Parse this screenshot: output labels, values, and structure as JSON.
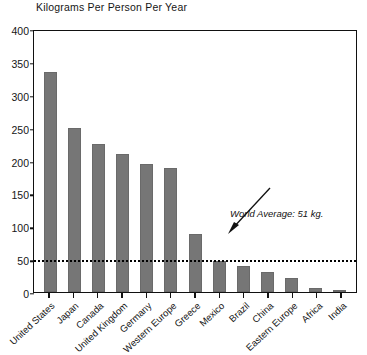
{
  "chart_data": {
    "type": "bar",
    "title": "Kilograms Per Person Per Year",
    "xlabel": "",
    "ylabel": "Kilograms Per Person Per Year",
    "ylim": [
      0,
      400
    ],
    "yticks": [
      400,
      350,
      300,
      250,
      200,
      150,
      100,
      50,
      0
    ],
    "grid": false,
    "legend": null,
    "categories": [
      "United States",
      "Japan",
      "Canada",
      "United Kingdom",
      "Germany",
      "Western Europe",
      "Greece",
      "Mexico",
      "Brazil",
      "China",
      "Eastern Europe",
      "Africa",
      "India"
    ],
    "values": [
      335,
      250,
      225,
      210,
      195,
      188,
      88,
      47,
      40,
      30,
      22,
      6,
      3
    ],
    "bar_color": "#767676",
    "annotations": [
      {
        "name": "world-average",
        "label": "World Average: 51 kg.",
        "value": 51,
        "type": "reference-line",
        "style": "dotted"
      },
      {
        "name": "source",
        "label": "Source: See endnote 14.",
        "type": "text"
      }
    ]
  },
  "chart": {
    "title": "Kilograms Per Person Per Year",
    "source_note": "Source: See endnote 14.",
    "average_label": "World Average: 51 kg."
  }
}
